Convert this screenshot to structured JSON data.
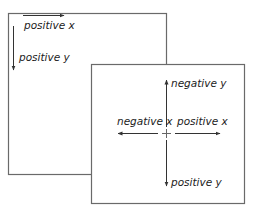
{
  "diagram": {
    "screen_box": {
      "labels": {
        "x_axis": "positive x",
        "y_axis": "positive y"
      }
    },
    "centered_box": {
      "labels": {
        "up": "negative y",
        "left": "negative x",
        "right": "positive x",
        "down": "positive y"
      }
    },
    "colors": {
      "stroke": "#555555",
      "box_border": "#6a6a6a",
      "text": "#222222"
    }
  }
}
